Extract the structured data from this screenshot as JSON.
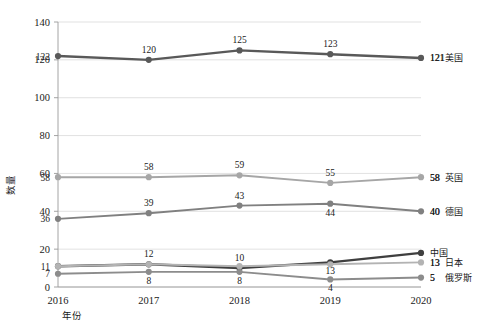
{
  "chart_data": {
    "type": "line",
    "title": "",
    "xlabel": "年份",
    "ylabel": "数量",
    "categories": [
      "2016",
      "2017",
      "2018",
      "2019",
      "2020"
    ],
    "ylim": [
      0,
      140
    ],
    "ytick_step": 20,
    "yticks": [
      "0",
      "20",
      "40",
      "60",
      "80",
      "100",
      "120",
      "140"
    ],
    "grid": true,
    "legend_position": "right-inline-end-of-line",
    "series": [
      {
        "name": "美国",
        "color": "#595959",
        "values": [
          122,
          120,
          125,
          123,
          121
        ],
        "labels": [
          "122",
          "120",
          "125",
          "123",
          "121"
        ],
        "label_positions": [
          "left",
          "above",
          "above",
          "above",
          "right"
        ],
        "end_label": "121",
        "end_name": "美国"
      },
      {
        "name": "英国",
        "color": "#a6a6a6",
        "values": [
          58,
          58,
          59,
          55,
          58
        ],
        "labels": [
          "58",
          "58",
          "59",
          "55",
          "58"
        ],
        "label_positions": [
          "left",
          "above",
          "above",
          "above",
          "right"
        ],
        "end_label": "58",
        "end_name": "英国"
      },
      {
        "name": "德国",
        "color": "#808080",
        "values": [
          36,
          39,
          43,
          44,
          40
        ],
        "labels": [
          "36",
          "39",
          "43",
          "44",
          "40"
        ],
        "label_positions": [
          "left",
          "above",
          "above",
          "below",
          "right"
        ],
        "end_label": "40",
        "end_name": "德国"
      },
      {
        "name": "中国",
        "color": "#3f3f3f",
        "values": [
          11,
          12,
          10,
          13,
          18
        ],
        "labels": [
          "11",
          "12",
          "10",
          "13",
          ""
        ],
        "label_positions": [
          "left",
          "above",
          "above",
          "below",
          "right"
        ],
        "end_label": "",
        "end_name": "中国"
      },
      {
        "name": "日本",
        "color": "#b3b3b3",
        "values": [
          11,
          12,
          11,
          12,
          13
        ],
        "labels": [
          "",
          "",
          "",
          "",
          "13"
        ],
        "label_positions": [
          "left",
          "above",
          "above",
          "above",
          "right"
        ],
        "end_label": "13",
        "end_name": "日本"
      },
      {
        "name": "俄罗斯",
        "color": "#8c8c8c",
        "values": [
          7,
          8,
          8,
          4,
          5
        ],
        "labels": [
          "7",
          "8",
          "8",
          "4",
          "5"
        ],
        "label_positions": [
          "left",
          "below",
          "below",
          "below",
          "right"
        ],
        "end_label": "5",
        "end_name": "俄罗斯"
      }
    ]
  },
  "axis": {
    "y_title": "数量",
    "x_title": "年份"
  }
}
